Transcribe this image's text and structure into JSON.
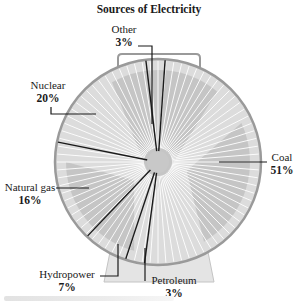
{
  "chart_data": {
    "type": "pie",
    "title": "Sources of Electricity",
    "style": "pictorial pie chart drawn as an electric fan; slices separated by dark divider lines",
    "categories": [
      "Coal",
      "Petroleum",
      "Hydropower",
      "Natural gas",
      "Nuclear",
      "Other"
    ],
    "values": [
      51,
      3,
      7,
      16,
      20,
      3
    ],
    "unit": "%",
    "labels": [
      {
        "name": "Coal",
        "value": "51%",
        "position": "right"
      },
      {
        "name": "Petroleum",
        "value": "3%",
        "position": "bottom"
      },
      {
        "name": "Hydropower",
        "value": "7%",
        "position": "bottom-left"
      },
      {
        "name": "Natural gas",
        "value": "16%",
        "position": "left"
      },
      {
        "name": "Nuclear",
        "value": "20%",
        "position": "upper-left"
      },
      {
        "name": "Other",
        "value": "3%",
        "position": "top"
      }
    ],
    "legend": "none (direct labels with leader lines)"
  },
  "colors": {
    "fan_rim": "#9a9a9a",
    "fan_fill": "#dedede",
    "blade_shade": "#bdbdbd",
    "blade_lines": "#ffffff",
    "divider": "#1a1a1a",
    "hub": "#c8c8c8",
    "base": "#e4e4e4"
  }
}
